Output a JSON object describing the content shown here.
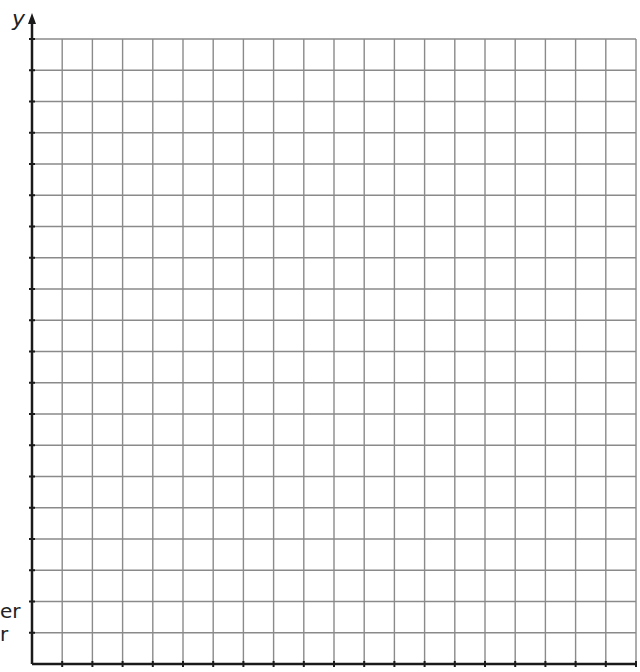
{
  "axes": {
    "y_label": "y",
    "x_label": ""
  },
  "clipped_text": {
    "line1": "er",
    "line2": "r"
  },
  "grid": {
    "columns": 20,
    "rows": 20,
    "left": 32,
    "right": 636,
    "top": 39,
    "bottom": 664,
    "line_color": "#8a8a8a",
    "axis_color": "#1a1a1a"
  },
  "chart_data": {
    "type": "scatter",
    "title": "",
    "xlabel": "",
    "ylabel": "y",
    "x": [],
    "y": [],
    "grid": true,
    "xlim": [
      0,
      20
    ],
    "ylim": [
      0,
      20
    ],
    "note": "Blank 20x20 coordinate grid with y-axis arrow; no data plotted"
  }
}
